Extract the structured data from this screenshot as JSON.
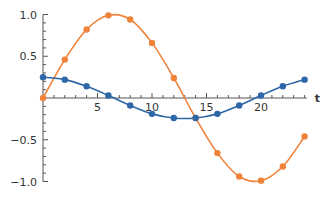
{
  "chart_data": {
    "type": "line",
    "title": "",
    "xlabel": "t",
    "ylabel": "",
    "xlim": [
      0,
      24.5
    ],
    "ylim": [
      -1.05,
      1.05
    ],
    "x_ticks": [
      5,
      10,
      15,
      20
    ],
    "y_ticks": [
      1.0,
      0.5,
      -0.5,
      -1.0
    ],
    "y_tick_labels": [
      "1.0",
      "0.5",
      "−0.5",
      "−1.0"
    ],
    "grid": false,
    "legend": null,
    "x": [
      0,
      2,
      4,
      6,
      8,
      10,
      12,
      14,
      16,
      18,
      20,
      22,
      24
    ],
    "series": [
      {
        "name": "orange",
        "color": "#F0833A",
        "values": [
          0.0,
          0.46,
          0.82,
          0.99,
          0.94,
          0.66,
          0.24,
          -0.24,
          -0.66,
          -0.94,
          -0.99,
          -0.82,
          -0.46
        ]
      },
      {
        "name": "blue",
        "color": "#2E67A8",
        "values": [
          0.25,
          0.22,
          0.14,
          0.03,
          -0.09,
          -0.19,
          -0.24,
          -0.24,
          -0.19,
          -0.09,
          0.03,
          0.14,
          0.22
        ]
      }
    ]
  }
}
